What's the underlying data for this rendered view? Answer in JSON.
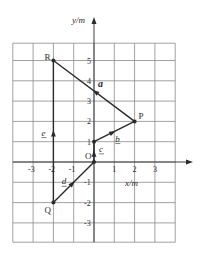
{
  "diagram": {
    "axes": {
      "x_label": "x/m",
      "y_label": "y/m",
      "x_ticks": [
        "-3",
        "-2",
        "-1",
        "1",
        "2",
        "3"
      ],
      "x_tick_values": [
        -3,
        -2,
        -1,
        1,
        2,
        3
      ],
      "y_ticks": [
        "5",
        "4",
        "3",
        "2",
        "1",
        "-1",
        "-2",
        "-3"
      ],
      "y_tick_values": [
        5,
        4,
        3,
        2,
        1,
        -1,
        -2,
        -3
      ],
      "x_range": [
        -4,
        4
      ],
      "y_range": [
        -4,
        6
      ]
    },
    "points": [
      {
        "name": "O",
        "x": 0,
        "y": 0
      },
      {
        "name": "P",
        "x": 2,
        "y": 2
      },
      {
        "name": "Q",
        "x": -2,
        "y": -2
      },
      {
        "name": "R",
        "x": -2,
        "y": 5
      }
    ],
    "vectors": [
      {
        "label": "a",
        "from": "P",
        "to": "R",
        "style": "bold-italic"
      },
      {
        "label": "b",
        "from": [
          0,
          1
        ],
        "to": "P",
        "style": "underlined"
      },
      {
        "label": "c",
        "from": "O",
        "to": [
          0,
          1
        ],
        "style": "underlined"
      },
      {
        "label": "d",
        "from": "Q",
        "to": "O",
        "style": "underlined"
      },
      {
        "label": "e",
        "from": "Q",
        "to": "R",
        "style": "underlined"
      }
    ],
    "colors": {
      "line": "#2a2a2a",
      "grid": "#8a8a8a"
    }
  }
}
